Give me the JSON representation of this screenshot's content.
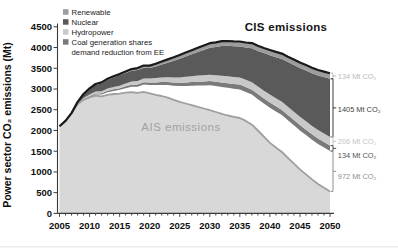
{
  "labels": {
    "cis": "CIS emissions",
    "ais": "AIS emissions"
  },
  "legend": {
    "items": [
      {
        "label": "Renewable",
        "color": "#9c9c9c"
      },
      {
        "label": "Nuclear",
        "color": "#5a5a5a"
      },
      {
        "label": "Hydropower",
        "color": "#c9c9c9"
      },
      {
        "label": "Coal generation shares",
        "color": "#7a7a7a"
      }
    ],
    "wrap_line": "demand reduction from EE"
  },
  "annotations": [
    {
      "label": "134 Mt CO₂",
      "series": "Renewable",
      "color": "#b9b9b9"
    },
    {
      "label": "1405 Mt CO₂",
      "series": "Nuclear",
      "color": "#3d3d3d"
    },
    {
      "label": "206 Mt CO₂",
      "series": "Hydropower",
      "color": "#c4c4c4"
    },
    {
      "label": "134 Mt CO₂",
      "series": "Coal generation shares",
      "color": "#525252"
    },
    {
      "label": "972 Mt CO₂",
      "series": "demand reduction from EE",
      "color": "#8f8f8f"
    }
  ],
  "chart_data": {
    "type": "area",
    "title": "",
    "xlabel": "",
    "ylabel": "Power sector CO₂ emissions (Mt)",
    "ylim": [
      0,
      4500
    ],
    "yticks": [
      0,
      500,
      1000,
      1500,
      2000,
      2500,
      3000,
      3500,
      4000,
      4500
    ],
    "xticks": [
      2005,
      2010,
      2015,
      2020,
      2025,
      2030,
      2035,
      2040,
      2045,
      2050
    ],
    "grid": false,
    "legend_position": "top-left",
    "top_line": {
      "label": "CIS emissions",
      "color": "#1a1a1a"
    },
    "years": [
      2005,
      2006,
      2007,
      2008,
      2009,
      2010,
      2011,
      2012,
      2013,
      2014,
      2015,
      2016,
      2017,
      2018,
      2019,
      2020,
      2021,
      2022,
      2023,
      2024,
      2025,
      2026,
      2027,
      2028,
      2029,
      2030,
      2031,
      2032,
      2033,
      2034,
      2035,
      2036,
      2037,
      2038,
      2039,
      2040,
      2041,
      2042,
      2043,
      2044,
      2045,
      2046,
      2047,
      2048,
      2049,
      2050
    ],
    "stack_order": [
      "AIS emissions",
      "demand reduction from EE",
      "Coal generation shares",
      "Hydropower",
      "Nuclear",
      "Renewable"
    ],
    "series": [
      {
        "name": "AIS emissions",
        "fill": "#d8d8d8",
        "edge": "#9f9f9f",
        "values": [
          2100,
          2230,
          2420,
          2630,
          2740,
          2800,
          2840,
          2825,
          2860,
          2880,
          2890,
          2910,
          2925,
          2905,
          2930,
          2895,
          2860,
          2830,
          2790,
          2740,
          2690,
          2650,
          2610,
          2570,
          2530,
          2490,
          2445,
          2400,
          2360,
          2330,
          2300,
          2230,
          2140,
          2000,
          1850,
          1700,
          1590,
          1480,
          1340,
          1200,
          1060,
          940,
          820,
          710,
          620,
          530
        ]
      },
      {
        "name": "demand reduction from EE",
        "fill": "#ffffff",
        "values": [
          0,
          0,
          0,
          0,
          0,
          10,
          25,
          40,
          60,
          75,
          90,
          110,
          130,
          150,
          175,
          200,
          235,
          270,
          305,
          340,
          380,
          425,
          470,
          515,
          558,
          600,
          625,
          650,
          670,
          678,
          690,
          700,
          725,
          755,
          800,
          850,
          870,
          890,
          908,
          925,
          940,
          948,
          955,
          962,
          968,
          972
        ]
      },
      {
        "name": "Coal generation shares",
        "fill": "#7a7a7a",
        "values": [
          0,
          0,
          0,
          0,
          10,
          20,
          28,
          33,
          36,
          38,
          40,
          44,
          48,
          52,
          56,
          60,
          64,
          68,
          72,
          76,
          80,
          84,
          88,
          92,
          96,
          100,
          103,
          106,
          109,
          112,
          115,
          117,
          119,
          121,
          123,
          125,
          126,
          127,
          128,
          129,
          130,
          131,
          132,
          133,
          133,
          134
        ]
      },
      {
        "name": "Hydropower",
        "fill": "#c9c9c9",
        "values": [
          0,
          0,
          0,
          15,
          30,
          40,
          45,
          50,
          54,
          57,
          60,
          68,
          76,
          84,
          92,
          100,
          106,
          112,
          118,
          124,
          130,
          135,
          140,
          145,
          150,
          155,
          159,
          163,
          167,
          171,
          175,
          178,
          181,
          184,
          187,
          190,
          192,
          194,
          196,
          198,
          200,
          201,
          203,
          204,
          205,
          206
        ]
      },
      {
        "name": "Nuclear",
        "fill": "#5a5a5a",
        "values": [
          0,
          0,
          0,
          40,
          90,
          130,
          160,
          185,
          210,
          230,
          250,
          255,
          260,
          265,
          258,
          250,
          280,
          310,
          350,
          400,
          450,
          490,
          530,
          570,
          610,
          650,
          680,
          720,
          735,
          740,
          745,
          775,
          820,
          860,
          905,
          950,
          990,
          1035,
          1080,
          1130,
          1180,
          1225,
          1270,
          1315,
          1360,
          1405
        ]
      },
      {
        "name": "Renewable",
        "fill": "#9c9c9c",
        "values": [
          0,
          0,
          0,
          0,
          10,
          18,
          22,
          25,
          27,
          29,
          30,
          36,
          42,
          48,
          54,
          60,
          66,
          72,
          78,
          84,
          90,
          94,
          98,
          102,
          106,
          110,
          112,
          114,
          116,
          118,
          120,
          121,
          122,
          123,
          124,
          125,
          126,
          127,
          128,
          129,
          130,
          131,
          132,
          133,
          133,
          134
        ]
      }
    ]
  }
}
